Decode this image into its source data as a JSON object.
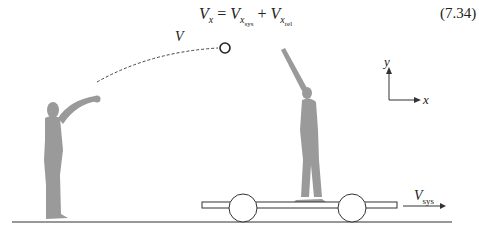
{
  "equation": {
    "lhs": "V",
    "lhs_sub": "x",
    "equals": "=",
    "term1": "V",
    "term1_sub": "x",
    "term1_subsub": "sys",
    "plus": "+",
    "term2": "V",
    "term2_sub": "x",
    "term2_subsub": "rel",
    "number": "(7.34)"
  },
  "diagram": {
    "ball_velocity_label": "V",
    "cart_velocity_label": "V",
    "cart_velocity_sub": "sys",
    "axis_y_label": "y",
    "axis_x_label": "x",
    "figure_color": "#9a9a9a",
    "line_color": "#333333"
  }
}
